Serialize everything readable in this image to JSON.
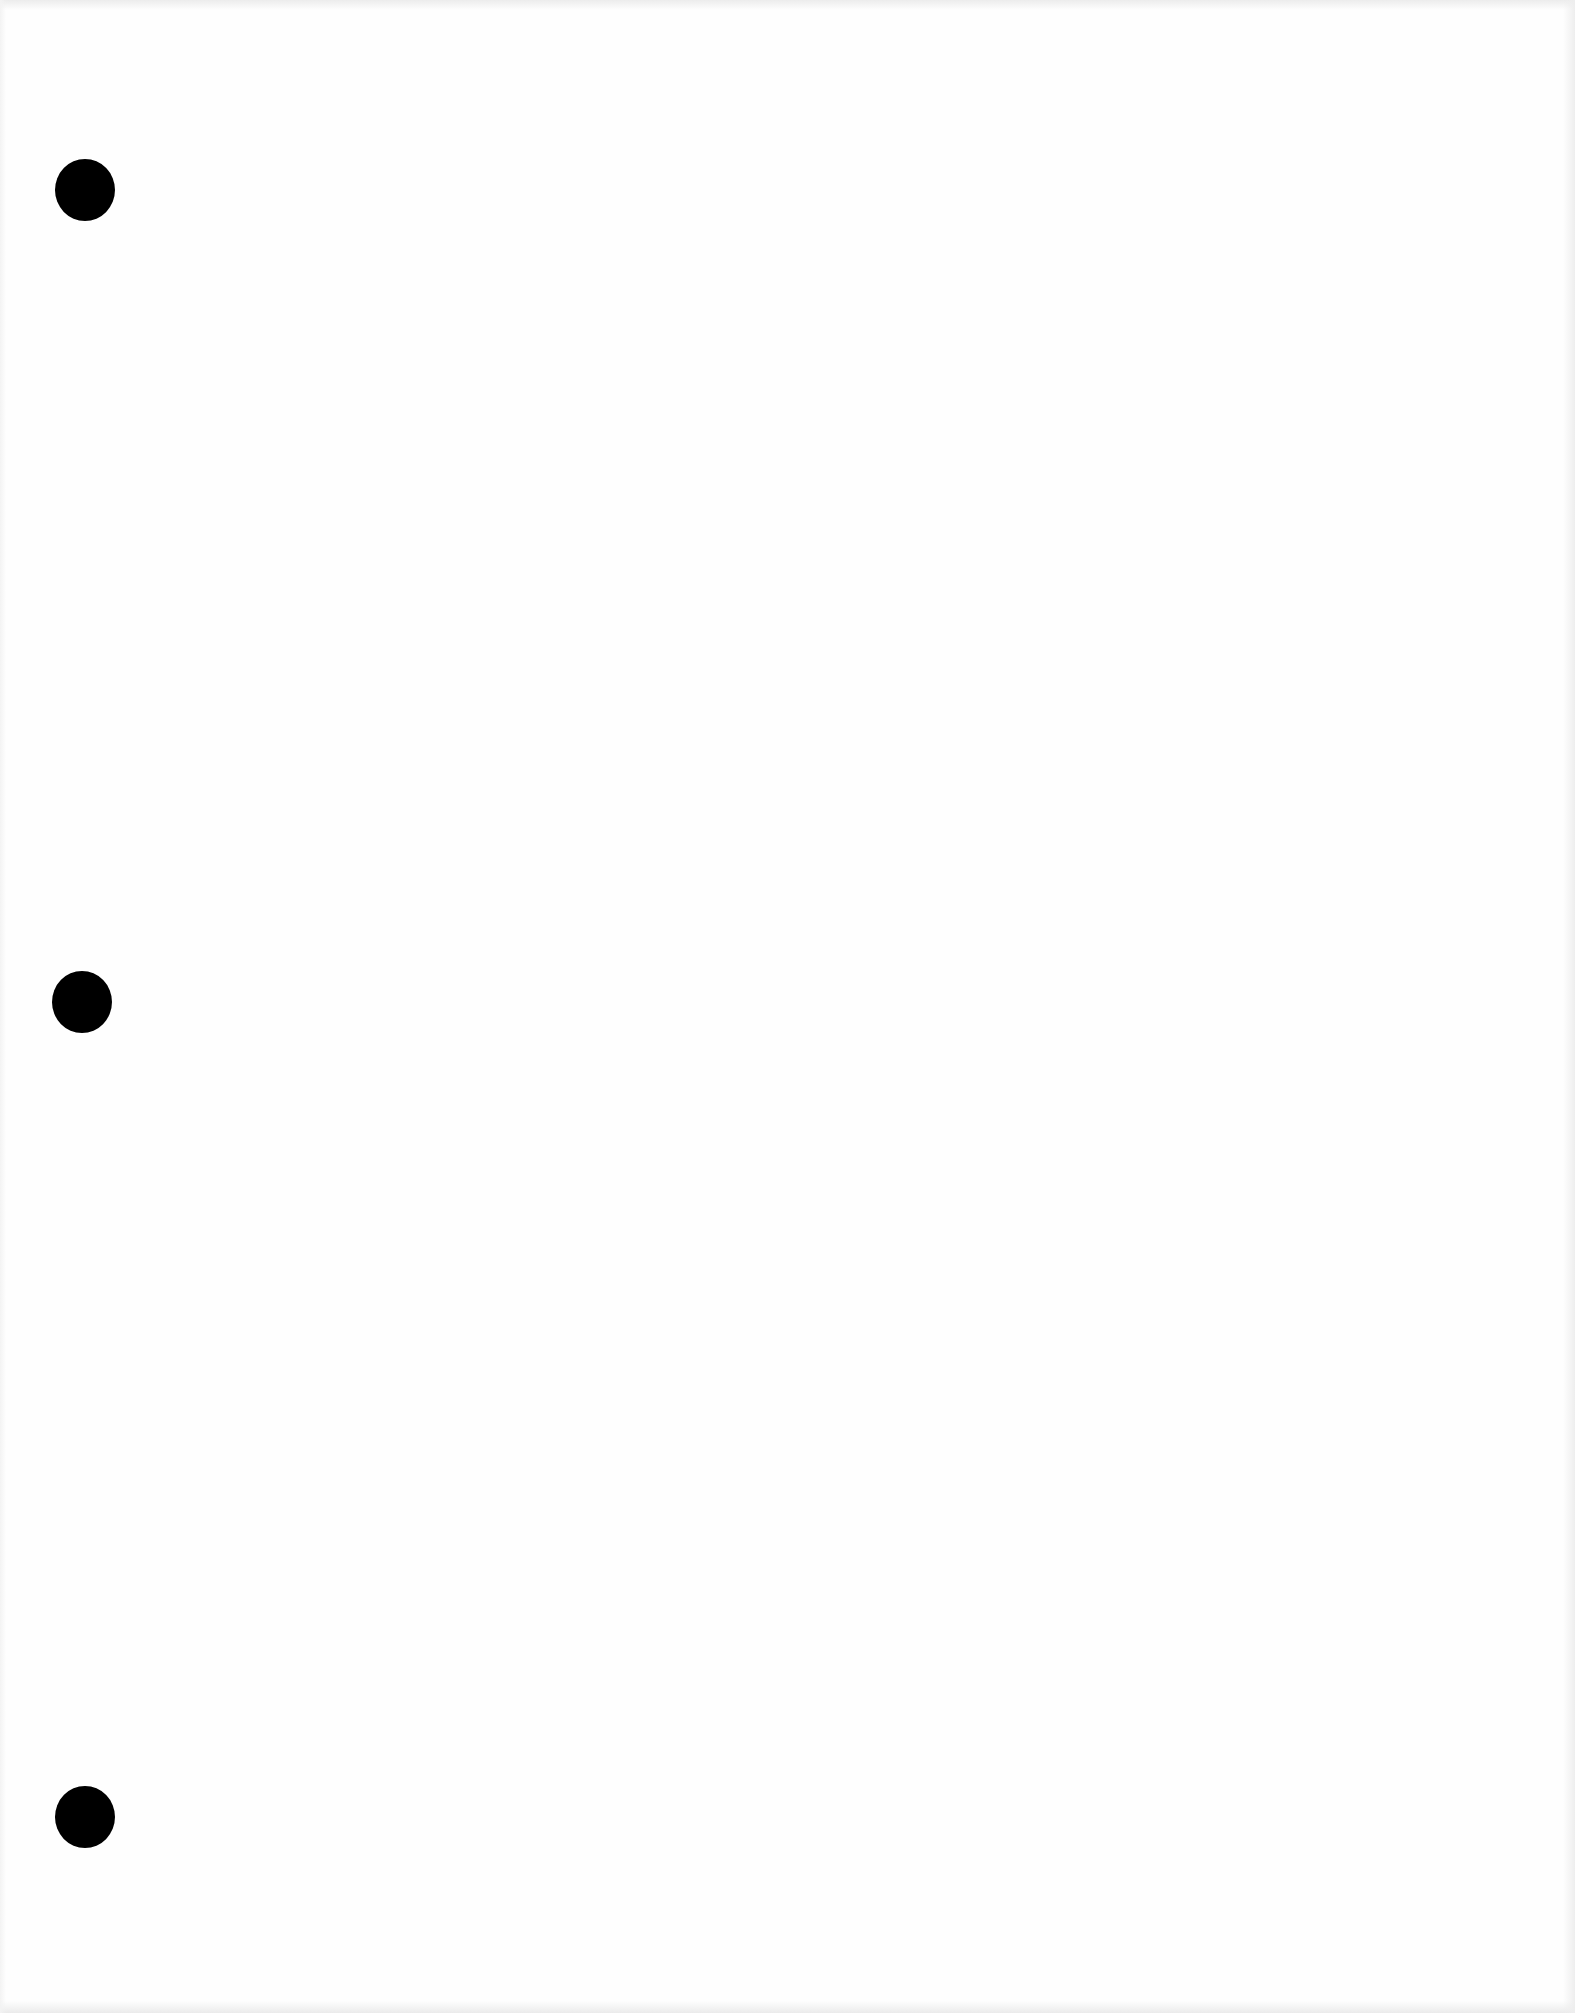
{
  "page": {
    "background_color": "#fefefe",
    "text_content": []
  },
  "punch_holes": [
    {
      "cx": 85,
      "cy": 190,
      "color": "#000000"
    },
    {
      "cx": 82,
      "cy": 1002,
      "color": "#000000"
    },
    {
      "cx": 85,
      "cy": 1817,
      "color": "#000000"
    }
  ]
}
